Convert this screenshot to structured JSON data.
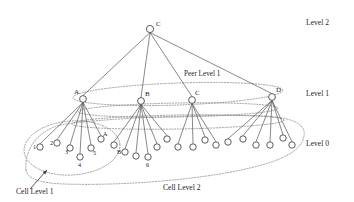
{
  "figure": {
    "background_color": "#ffffff",
    "line_color": "#555555",
    "node_stroke_color": "#4a4a4a",
    "dotted_color": "#8a8a8a",
    "text_color": "#1d1d1d"
  },
  "level_labels": [
    {
      "text": "Level 2",
      "x": 306,
      "y": 25
    },
    {
      "text": "Level 1",
      "x": 306,
      "y": 96
    },
    {
      "text": "Level 0",
      "x": 306,
      "y": 146
    }
  ],
  "region_labels": [
    {
      "text": "Peer Level 1",
      "x": 184,
      "y": 76
    },
    {
      "text": "Cell Level 1",
      "x": 16,
      "y": 194
    },
    {
      "text": "Cell Level 2",
      "x": 163,
      "y": 190
    }
  ],
  "nodes": {
    "level2": [
      {
        "id": "root",
        "label": "C",
        "x": 150,
        "y": 29,
        "r": 3.6,
        "label_dx": 6,
        "label_dy": -3
      }
    ],
    "level1": [
      {
        "id": "L1A",
        "label": "A",
        "x": 83,
        "y": 99,
        "r": 3.4,
        "label_dx": -9,
        "label_dy": -5
      },
      {
        "id": "L1B",
        "label": "B",
        "x": 141,
        "y": 101,
        "r": 3.4,
        "label_dx": 4,
        "label_dy": -5
      },
      {
        "id": "L1C",
        "label": "C",
        "x": 192,
        "y": 100,
        "r": 3.4,
        "label_dx": 3,
        "label_dy": -5
      },
      {
        "id": "L1D",
        "label": "D",
        "x": 272,
        "y": 97,
        "r": 3.4,
        "label_dx": 4,
        "label_dy": -5
      }
    ],
    "level0": [
      {
        "id": "a1",
        "parent": "L1A",
        "label": "1",
        "x": 40,
        "y": 147,
        "r": 3.2,
        "label_dx": -7,
        "label_dy": 2
      },
      {
        "id": "a2",
        "parent": "L1A",
        "label": "2",
        "x": 57,
        "y": 143,
        "r": 3.2,
        "label_dx": -7,
        "label_dy": 2
      },
      {
        "id": "a3",
        "parent": "L1A",
        "label": "3",
        "x": 70,
        "y": 148,
        "r": 3.2,
        "label_dx": -5,
        "label_dy": 6
      },
      {
        "id": "a4",
        "parent": "L1A",
        "label": "4",
        "x": 80,
        "y": 157,
        "r": 3.2,
        "label_dx": -2,
        "label_dy": 10
      },
      {
        "id": "a5",
        "parent": "L1A",
        "label": "5",
        "x": 91,
        "y": 148,
        "r": 3.2,
        "label_dx": 2,
        "label_dy": 7
      },
      {
        "id": "a6",
        "parent": "L1A",
        "label": "A",
        "x": 101,
        "y": 139,
        "r": 3.2,
        "label_dx": 2,
        "label_dy": -3
      },
      {
        "id": "b1",
        "parent": "L1B",
        "label": "",
        "x": 114,
        "y": 145,
        "r": 3.2,
        "label_dx": 0,
        "label_dy": 0
      },
      {
        "id": "b2",
        "parent": "L1B",
        "label": "B",
        "x": 125,
        "y": 152,
        "r": 3.2,
        "label_dx": -8,
        "label_dy": 2
      },
      {
        "id": "b3",
        "parent": "L1B",
        "label": "",
        "x": 136,
        "y": 156,
        "r": 3.2,
        "label_dx": 0,
        "label_dy": 0
      },
      {
        "id": "b4",
        "parent": "L1B",
        "label": "6",
        "x": 148,
        "y": 157,
        "r": 3.2,
        "label_dx": -2,
        "label_dy": 10
      },
      {
        "id": "b5",
        "parent": "L1B",
        "label": "",
        "x": 157,
        "y": 147,
        "r": 3.2,
        "label_dx": 0,
        "label_dy": 0
      },
      {
        "id": "b6",
        "parent": "L1B",
        "label": "",
        "x": 167,
        "y": 139,
        "r": 3.2,
        "label_dx": 0,
        "label_dy": 0
      },
      {
        "id": "c1",
        "parent": "L1C",
        "label": "",
        "x": 178,
        "y": 147,
        "r": 3.2,
        "label_dx": 0,
        "label_dy": 0
      },
      {
        "id": "c2",
        "parent": "L1C",
        "label": "",
        "x": 193,
        "y": 147,
        "r": 3.2,
        "label_dx": 0,
        "label_dy": 0
      },
      {
        "id": "c3",
        "parent": "L1C",
        "label": "",
        "x": 205,
        "y": 140,
        "r": 3.2,
        "label_dx": 0,
        "label_dy": 0
      },
      {
        "id": "c4",
        "parent": "L1C",
        "label": "",
        "x": 216,
        "y": 145,
        "r": 3.2,
        "label_dx": 0,
        "label_dy": 0
      },
      {
        "id": "d1",
        "parent": "L1D",
        "label": "",
        "x": 228,
        "y": 142,
        "r": 3.2,
        "label_dx": 0,
        "label_dy": 0
      },
      {
        "id": "d2",
        "parent": "L1D",
        "label": "",
        "x": 243,
        "y": 139,
        "r": 3.2,
        "label_dx": 0,
        "label_dy": 0
      },
      {
        "id": "d3",
        "parent": "L1D",
        "label": "",
        "x": 256,
        "y": 145,
        "r": 3.2,
        "label_dx": 0,
        "label_dy": 0
      },
      {
        "id": "d4",
        "parent": "L1D",
        "label": "",
        "x": 270,
        "y": 145,
        "r": 3.2,
        "label_dx": 0,
        "label_dy": 0
      },
      {
        "id": "d5",
        "parent": "L1D",
        "label": "",
        "x": 283,
        "y": 138,
        "r": 3.2,
        "label_dx": 0,
        "label_dy": 0
      },
      {
        "id": "d6",
        "parent": "L1D",
        "label": "",
        "x": 292,
        "y": 145,
        "r": 3.2,
        "label_dx": 0,
        "label_dy": 0
      }
    ]
  },
  "edges": {
    "root_to_level1": [
      {
        "from": "root",
        "to": "L1A"
      },
      {
        "from": "root",
        "to": "L1B"
      },
      {
        "from": "root",
        "to": "L1C"
      },
      {
        "from": "root",
        "to": "L1D"
      }
    ]
  },
  "regions": {
    "peer_level_1_ellipse": {
      "name": "peer-level-1-region",
      "cx": 178,
      "cy": 94,
      "rx": 105,
      "ry": 11,
      "rotate": -2
    },
    "level1_dotted_bands": [
      {
        "name": "band-upper",
        "cx": 178,
        "cy": 110,
        "rx": 100,
        "ry": 7,
        "rotate": -1
      },
      {
        "name": "band-lower",
        "cx": 178,
        "cy": 122,
        "rx": 106,
        "ry": 7,
        "rotate": -1
      }
    ],
    "cell_level_1": {
      "name": "cell-level-1-region",
      "cx": 72,
      "cy": 148,
      "rx": 48,
      "ry": 27,
      "rotate": -4
    },
    "cell_level_2": {
      "name": "cell-level-2-region",
      "path": "M 26 170 C 24 150 38 128 66 124 C 110 118 200 114 262 116 C 296 117 306 126 304 136 C 302 150 284 160 250 168 C 200 180 120 186 64 184 C 38 183 27 178 26 170 Z"
    }
  },
  "annotation_arrow": {
    "name": "cell-level-1-pointer",
    "x1": 30,
    "y1": 189,
    "x2": 47,
    "y2": 170
  }
}
